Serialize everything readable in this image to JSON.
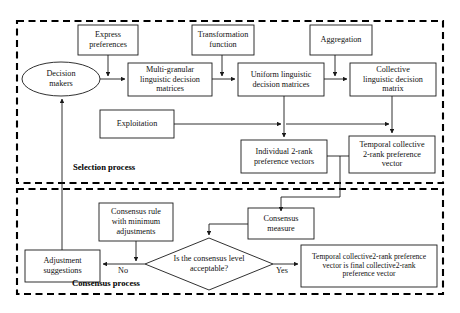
{
  "diagram": {
    "title_not_shown": "",
    "sections": [
      {
        "id": "selection",
        "label": "Selection process"
      },
      {
        "id": "consensus",
        "label": "Consensus process"
      }
    ],
    "nodes": {
      "decision_makers": "Decision\nmakers",
      "express_preferences": "Express\npreferences",
      "transformation_function": "Transformation\nfunction",
      "aggregation": "Aggregation",
      "multi_granular": "Multi-granular\nlinguistic decision\nmatrices",
      "uniform_linguistic": "Uniform linguistic\ndecision matrices",
      "collective_linguistic": "Collective\nlinguistic decision\nmatrix",
      "exploitation": "Exploitation",
      "individual_2rank": "Individual 2-rank\npreference vectors",
      "temporal_collective": "Temporal collective\n2-rank preference\nvector",
      "consensus_rule": "Consensus rule\nwith minimum\nadjustments",
      "consensus_measure": "Consensus\nmeasure",
      "adjustment_suggestions": "Adjustment\nsuggestions",
      "decision_diamond": "Is the consensus level\nacceptable?",
      "final_vector": "Temporal collective2-rank preference\nvector is final collective2-rank\npreference vector"
    },
    "edge_labels": {
      "no": "No",
      "yes": "Yes"
    },
    "colors": {
      "stroke": "#1a1a1a",
      "text": "#111111",
      "background": "#ffffff",
      "dashed_border": "#000000"
    }
  }
}
